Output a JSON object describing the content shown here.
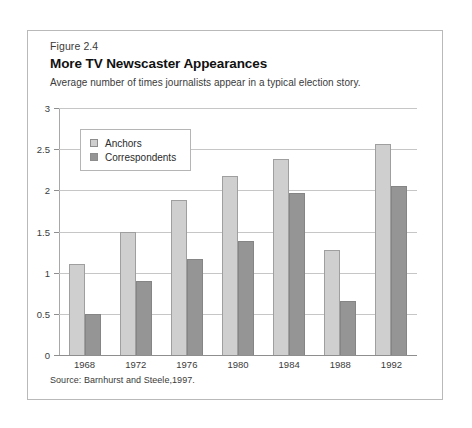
{
  "figure": {
    "number": "Figure 2.4",
    "title": "More TV Newscaster Appearances",
    "subtitle": "Average number of times journalists appear in a typical election story.",
    "source": "Source: Barnhurst and Steele,1997."
  },
  "legend": {
    "position": "inside-top-left",
    "entries": [
      {
        "label": "Anchors",
        "color": "#cfcfcf",
        "swatch": "legend-swatch-anchors"
      },
      {
        "label": "Correspondents",
        "color": "#959595",
        "swatch": "legend-swatch-correspondents"
      }
    ]
  },
  "axes": {
    "y_ticks": [
      "0",
      "0.5",
      "1",
      "1.5",
      "2",
      "2.5",
      "3"
    ],
    "x_ticks": [
      "1968",
      "1972",
      "1976",
      "1980",
      "1984",
      "1988",
      "1992"
    ]
  },
  "chart_data": {
    "type": "bar",
    "title": "More TV Newscaster Appearances",
    "subtitle": "Average number of times journalists appear in a typical election story.",
    "xlabel": "",
    "ylabel": "",
    "ylim": [
      0,
      3
    ],
    "ytick_step": 0.5,
    "grid": true,
    "legend_position": "inside-top-left",
    "categories": [
      "1968",
      "1972",
      "1976",
      "1980",
      "1984",
      "1988",
      "1992"
    ],
    "series": [
      {
        "name": "Anchors",
        "color": "#cfcfcf",
        "values": [
          1.1,
          1.5,
          1.88,
          2.17,
          2.38,
          1.28,
          2.56
        ]
      },
      {
        "name": "Correspondents",
        "color": "#959595",
        "values": [
          0.5,
          0.9,
          1.17,
          1.38,
          1.97,
          0.65,
          2.05
        ]
      }
    ],
    "source": "Source: Barnhurst and Steele,1997."
  }
}
